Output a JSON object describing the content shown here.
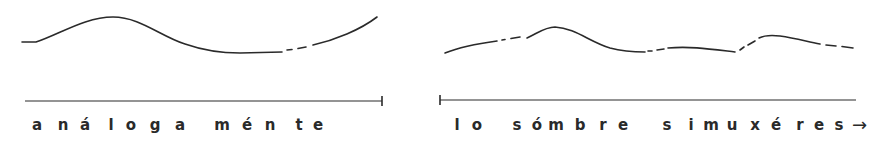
{
  "diagram": {
    "type": "intonation-contour",
    "ink_color": "#2a2a2a",
    "panels": [
      {
        "id": "left",
        "contour": {
          "solid_segments": [
            "M22,42 L36,42 C60,34 85,17 113,17 C140,17 160,36 185,44 C205,51 220,53 240,53 L282,52",
            "M313,45 C335,40 360,30 377,17"
          ],
          "dashed_segments": [
            "M287,50 L292,49.5",
            "M298,48.5 L306,47"
          ]
        },
        "baseline": {
          "x1": 25,
          "x2": 382,
          "y": 101,
          "tick": "right"
        },
        "syllables": [
          {
            "t": "a",
            "x": 37
          },
          {
            "t": "n",
            "x": 63
          },
          {
            "t": "á",
            "x": 85
          },
          {
            "t": "l",
            "x": 111
          },
          {
            "t": "o",
            "x": 131
          },
          {
            "t": "g",
            "x": 155
          },
          {
            "t": "a",
            "x": 180
          },
          {
            "t": "m",
            "x": 222
          },
          {
            "t": "é",
            "x": 247
          },
          {
            "t": "n",
            "x": 270
          },
          {
            "t": "t",
            "x": 299
          },
          {
            "t": "e",
            "x": 318
          }
        ],
        "text": "análoga ménte"
      },
      {
        "id": "right",
        "contour": {
          "solid_segments": [
            "M445,53 C460,47 475,44 497,41",
            "M527,38 C538,33 545,27 555,27 C575,28 590,42 610,48 C625,52 635,52 645,52",
            "M668,48 C690,46 710,49 735,52",
            "M759,38 C765,35 772,35 780,36 C795,38 805,41 820,44"
          ],
          "dashed_segments": [
            "M502,40 L505,39.5",
            "M511,38.5 L520,37",
            "M648,51 L652,51",
            "M657,50 L664,49",
            "M740,50 L744,47",
            "M748,45 L755,41",
            "M826,45 L836,46",
            "M842,46.5 L853,48"
          ]
        },
        "baseline": {
          "x1": 440,
          "x2": 856,
          "y": 100,
          "tick": "left"
        },
        "syllables": [
          {
            "t": "l",
            "x": 457
          },
          {
            "t": "o",
            "x": 477
          },
          {
            "t": "s",
            "x": 517
          },
          {
            "t": "ó",
            "x": 537
          },
          {
            "t": "m",
            "x": 556
          },
          {
            "t": "b",
            "x": 580
          },
          {
            "t": "r",
            "x": 603
          },
          {
            "t": "e",
            "x": 623
          },
          {
            "t": "s",
            "x": 667
          },
          {
            "t": "i",
            "x": 691
          },
          {
            "t": "m",
            "x": 711
          },
          {
            "t": "u",
            "x": 732
          },
          {
            "t": "x",
            "x": 755
          },
          {
            "t": "é",
            "x": 776
          },
          {
            "t": "r",
            "x": 800
          },
          {
            "t": "e",
            "x": 819
          },
          {
            "t": "s",
            "x": 839
          }
        ],
        "text": "lo sómbre simuxéres",
        "continuation_arrow": "→"
      }
    ]
  }
}
